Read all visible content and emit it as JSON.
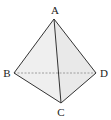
{
  "diagram": {
    "type": "tetrahedron",
    "title": "",
    "vertices": [
      {
        "id": "A",
        "label": "A",
        "x": 54,
        "y": 19,
        "label_x": 55,
        "label_y": 14
      },
      {
        "id": "B",
        "label": "B",
        "x": 14,
        "y": 73,
        "label_x": 7,
        "label_y": 77
      },
      {
        "id": "C",
        "label": "C",
        "x": 61,
        "y": 103,
        "label_x": 61,
        "label_y": 116
      },
      {
        "id": "D",
        "label": "D",
        "x": 96,
        "y": 73,
        "label_x": 104,
        "label_y": 77
      }
    ],
    "edges": [
      {
        "from": "A",
        "to": "B",
        "style": "solid"
      },
      {
        "from": "A",
        "to": "C",
        "style": "solid"
      },
      {
        "from": "A",
        "to": "D",
        "style": "solid"
      },
      {
        "from": "B",
        "to": "C",
        "style": "solid"
      },
      {
        "from": "C",
        "to": "D",
        "style": "solid"
      },
      {
        "from": "B",
        "to": "D",
        "style": "dashed"
      }
    ],
    "colors": {
      "edge": "#333333",
      "hidden_edge": "#888888",
      "face_fill": "#eeeeee"
    }
  }
}
